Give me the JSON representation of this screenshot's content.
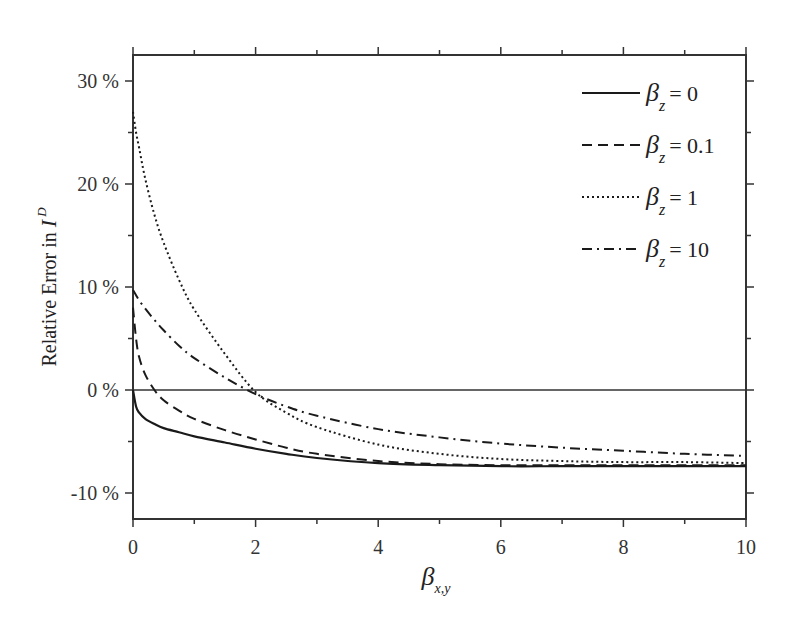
{
  "chart_data": {
    "type": "line",
    "title": "",
    "xlabel": "β_x,y",
    "ylabel": "Relative Error in I^D",
    "xlim": [
      0,
      10
    ],
    "ylim": [
      -12.5,
      32.5
    ],
    "x_ticks": [
      "0",
      "2",
      "4",
      "6",
      "8",
      "10"
    ],
    "y_ticks": [
      "30 %",
      "20 %",
      "10 %",
      "0 %",
      "-10 %"
    ],
    "grid": false,
    "legend_position": "upper right",
    "reference_line": {
      "y": 0
    },
    "x": [
      0,
      0.05,
      0.1,
      0.2,
      0.35,
      0.5,
      0.75,
      1,
      1.5,
      2,
      2.5,
      3,
      4,
      5,
      6,
      7,
      8,
      9,
      10
    ],
    "series": [
      {
        "name": "β_z = 0",
        "style": "solid",
        "values": [
          0,
          -1.6,
          -2.2,
          -2.8,
          -3.3,
          -3.7,
          -4.1,
          -4.5,
          -5.1,
          -5.7,
          -6.2,
          -6.6,
          -7.1,
          -7.3,
          -7.4,
          -7.4,
          -7.4,
          -7.4,
          -7.4
        ]
      },
      {
        "name": "β_z = 0.1",
        "style": "dashed",
        "values": [
          8.0,
          5.0,
          3.2,
          1.5,
          0,
          -1.0,
          -2.0,
          -2.8,
          -3.9,
          -4.8,
          -5.6,
          -6.2,
          -6.9,
          -7.2,
          -7.3,
          -7.3,
          -7.3,
          -7.3,
          -7.3
        ]
      },
      {
        "name": "β_z = 1",
        "style": "dotted",
        "values": [
          27.0,
          25.0,
          23.5,
          20.5,
          17.0,
          14.3,
          10.7,
          7.8,
          3.5,
          -0.2,
          -2.2,
          -3.6,
          -5.3,
          -6.2,
          -6.7,
          -6.9,
          -7.0,
          -7.0,
          -7.1
        ]
      },
      {
        "name": "β_z = 10",
        "style": "dash-dot",
        "values": [
          9.7,
          9.2,
          8.7,
          7.9,
          6.8,
          5.8,
          4.3,
          3.1,
          1.2,
          -0.4,
          -1.6,
          -2.5,
          -3.8,
          -4.6,
          -5.2,
          -5.6,
          -5.9,
          -6.2,
          -6.4
        ]
      }
    ]
  },
  "legend": [
    {
      "symbol": "β",
      "sub": "z",
      "text": "= 0"
    },
    {
      "symbol": "β",
      "sub": "z",
      "text": "= 0.1"
    },
    {
      "symbol": "β",
      "sub": "z",
      "text": "= 1"
    },
    {
      "symbol": "β",
      "sub": "z",
      "text": "= 10"
    }
  ],
  "axes": {
    "x_symbol": "β",
    "x_sub": "x,y",
    "y_label_text": "Relative Error in ",
    "y_label_symbol": "I",
    "y_label_sup": "D"
  }
}
